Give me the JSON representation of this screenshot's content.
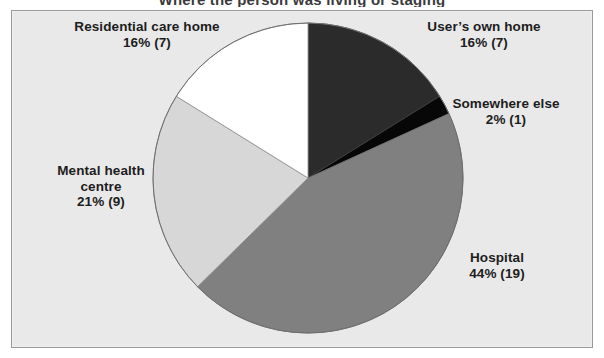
{
  "figure": {
    "clipped_title": "Where the person was living or staging",
    "background_color": "#e9e9e9",
    "frame_color": "#9a9a9a"
  },
  "chart_data": {
    "type": "pie",
    "title": "",
    "xlabel": "",
    "ylabel": "",
    "start_angle_deg": 0,
    "direction": "clockwise",
    "legend": "none",
    "grid": false,
    "categories": [
      "User's own home",
      "Somewhere else",
      "Hospital",
      "Mental health centre",
      "Residential care home"
    ],
    "values": [
      16,
      2,
      44,
      21,
      16
    ],
    "counts": [
      7,
      1,
      19,
      9,
      7
    ],
    "total_count": 43,
    "colors": [
      "#2b2b2b",
      "#070707",
      "#808080",
      "#d7d7d7",
      "#ffffff"
    ],
    "slices": [
      {
        "name": "User's own home",
        "label_line1": "User’s own home",
        "label_line2": "16% (7)",
        "percent": 16,
        "count": 7,
        "color": "#2b2b2b"
      },
      {
        "name": "Somewhere else",
        "label_line1": "Somewhere else",
        "label_line2": "2% (1)",
        "percent": 2,
        "count": 1,
        "color": "#070707"
      },
      {
        "name": "Hospital",
        "label_line1": "Hospital",
        "label_line2": "44% (19)",
        "percent": 44,
        "count": 19,
        "color": "#808080"
      },
      {
        "name": "Mental health centre",
        "label_line1": "Mental health",
        "label_line2": "centre",
        "label_line3": "21% (9)",
        "percent": 21,
        "count": 9,
        "color": "#d7d7d7"
      },
      {
        "name": "Residential care home",
        "label_line1": "Residential care home",
        "label_line2": "16% (7)",
        "percent": 16,
        "count": 7,
        "color": "#ffffff"
      }
    ]
  },
  "labels": {
    "residential": "Residential care home\n16% (7)",
    "users_own": "User’s own home\n16% (7)",
    "somewhere": "Somewhere else\n2% (1)",
    "hospital": "Hospital\n44% (19)",
    "mental": "Mental health\ncentre\n21% (9)"
  }
}
